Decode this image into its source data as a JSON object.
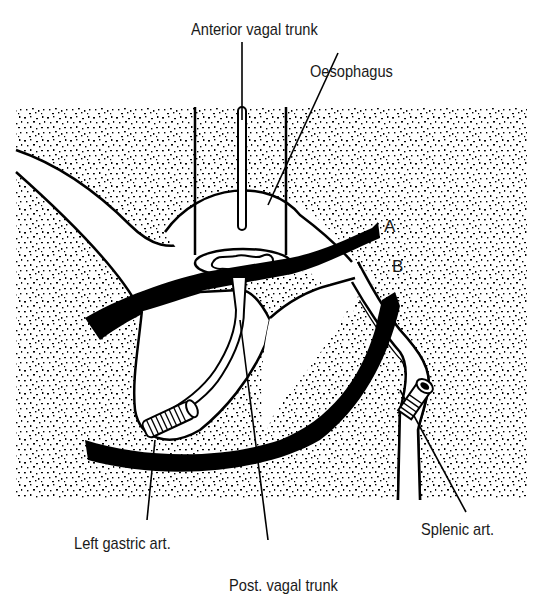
{
  "diagram": {
    "colors": {
      "ink": "#000000",
      "background": "#ffffff",
      "label_text": "#1a1a1a"
    }
  },
  "labels": {
    "anterior_vagal_trunk": "Anterior vagal trunk",
    "oesophagus": "Oesophagus",
    "marker_a": "A",
    "marker_b": "B",
    "left_gastric_art": "Left gastric art.",
    "post_vagal_trunk": "Post. vagal trunk",
    "splenic_art": "Splenic art."
  }
}
